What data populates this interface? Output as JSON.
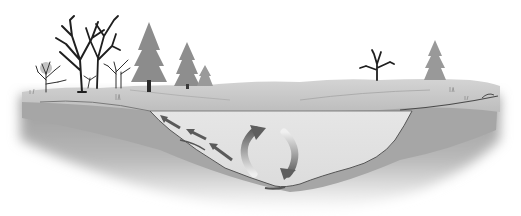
{
  "diagram": {
    "style": "grayscale-illustration",
    "colors": {
      "background": "#ffffff",
      "ground_surface": "#c8c8c8",
      "ground_dark": "#8f8f8f",
      "water": "#e2e2e2",
      "water_line": "#6e6e6e",
      "arrow_dark": "#5a5a5a",
      "arrow_light": "#d0d0d0",
      "tree_dark": "#2a2a2a",
      "conifer": "#8a8a8a"
    },
    "elements": {
      "trees_left": [
        "bare-tree",
        "bare-tree",
        "bare-tree",
        "bare-tree",
        "bare-tree",
        "conifer",
        "conifer",
        "conifer"
      ],
      "trees_right": [
        "bare-tree",
        "conifer"
      ],
      "arrows": [
        "flow-arrow-1",
        "flow-arrow-2",
        "flow-arrow-3",
        "circulation-arrow-up",
        "circulation-arrow-down"
      ]
    }
  }
}
